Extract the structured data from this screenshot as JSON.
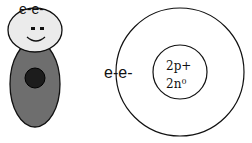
{
  "figure": {
    "character": {
      "hair_label": "e-e-",
      "head_color": "#ebebeb",
      "body_color": "#6e6e6e",
      "core_color": "#1c1c1c"
    },
    "atom": {
      "electron_label": "e-e-",
      "nucleus": {
        "protons": "2p+",
        "neutrons_base": "2n",
        "neutrons_sup": "0"
      }
    }
  }
}
